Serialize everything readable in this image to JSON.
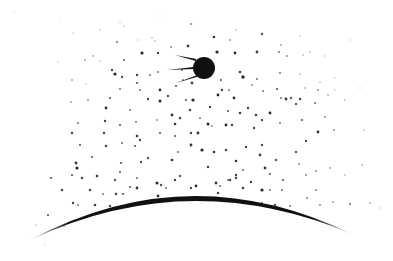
{
  "scene": {
    "description": "Illustration of a Sputnik-style satellite orbiting above a curved planet horizon in a star-speckled sky",
    "background_color": "#ffffff",
    "ink_color": "#111111",
    "satellite": {
      "icon": "sputnik-satellite-icon",
      "cx": 204,
      "cy": 68,
      "r": 11,
      "antennas": [
        {
          "x1": 196,
          "y1": 60,
          "x2": 175,
          "y2": 55
        },
        {
          "x1": 194,
          "y1": 68,
          "x2": 167,
          "y2": 70
        },
        {
          "x1": 197,
          "y1": 76,
          "x2": 176,
          "y2": 83
        }
      ]
    },
    "horizon": {
      "icon": "planet-horizon-arc",
      "start": [
        30,
        240
      ],
      "peak": [
        190,
        196
      ],
      "end": [
        352,
        234
      ],
      "thickness": 5
    },
    "stars": [
      [
        14,
        12,
        0.6,
        0.25
      ],
      [
        60,
        18,
        0.6,
        0.2
      ],
      [
        120,
        22,
        0.7,
        0.3
      ],
      [
        160,
        16,
        0.6,
        0.25
      ],
      [
        236,
        30,
        0.8,
        0.35
      ],
      [
        262,
        34,
        1.2,
        0.7
      ],
      [
        300,
        36,
        0.8,
        0.3
      ],
      [
        350,
        40,
        0.7,
        0.25
      ],
      [
        73,
        33,
        0.7,
        0.3
      ],
      [
        100,
        30,
        0.8,
        0.3
      ],
      [
        124,
        26,
        0.7,
        0.35
      ],
      [
        152,
        38,
        0.8,
        0.4
      ],
      [
        191,
        24,
        1.1,
        0.5
      ],
      [
        214,
        37,
        1.3,
        0.85
      ],
      [
        230,
        40,
        0.9,
        0.5
      ],
      [
        281,
        45,
        0.9,
        0.4
      ],
      [
        117,
        42,
        1.3,
        0.4
      ],
      [
        138,
        40,
        0.7,
        0.3
      ],
      [
        155,
        41,
        0.8,
        0.4
      ],
      [
        188,
        46,
        1.4,
        0.8
      ],
      [
        217,
        52,
        1.6,
        0.9
      ],
      [
        235,
        53,
        1.4,
        0.9
      ],
      [
        257,
        52,
        1.4,
        0.8
      ],
      [
        279,
        52,
        1.0,
        0.6
      ],
      [
        310,
        52,
        0.8,
        0.4
      ],
      [
        85,
        60,
        0.9,
        0.4
      ],
      [
        100,
        61,
        0.8,
        0.35
      ],
      [
        124,
        60,
        1.0,
        0.7
      ],
      [
        142,
        53,
        1.6,
        0.9
      ],
      [
        158,
        53,
        1.2,
        0.8
      ],
      [
        171,
        47,
        1.0,
        0.5
      ],
      [
        287,
        56,
        0.9,
        0.5
      ],
      [
        303,
        55,
        0.8,
        0.4
      ],
      [
        325,
        56,
        0.7,
        0.35
      ],
      [
        58,
        62,
        0.7,
        0.3
      ],
      [
        93,
        56,
        0.9,
        0.4
      ],
      [
        112,
        70,
        1.2,
        0.75
      ],
      [
        115,
        74,
        1.6,
        0.9
      ],
      [
        122,
        77,
        1.2,
        0.7
      ],
      [
        137,
        75,
        1.2,
        0.8
      ],
      [
        150,
        75,
        1.0,
        0.6
      ],
      [
        158,
        72,
        1.0,
        0.6
      ],
      [
        182,
        70,
        1.0,
        0.6
      ],
      [
        240,
        72,
        1.3,
        0.8
      ],
      [
        243,
        77,
        1.7,
        0.9
      ],
      [
        257,
        79,
        1.0,
        0.6
      ],
      [
        280,
        73,
        1.0,
        0.6
      ],
      [
        300,
        74,
        0.8,
        0.4
      ],
      [
        320,
        82,
        0.8,
        0.4
      ],
      [
        335,
        78,
        0.7,
        0.3
      ],
      [
        72,
        80,
        0.9,
        0.4
      ],
      [
        86,
        84,
        0.8,
        0.3
      ],
      [
        120,
        89,
        1.0,
        0.6
      ],
      [
        137,
        83,
        1.1,
        0.7
      ],
      [
        140,
        90,
        1.0,
        0.6
      ],
      [
        160,
        90,
        1.4,
        0.85
      ],
      [
        176,
        86,
        1.1,
        0.7
      ],
      [
        183,
        80,
        1.0,
        0.6
      ],
      [
        192,
        83,
        1.4,
        0.8
      ],
      [
        221,
        80,
        1.1,
        0.7
      ],
      [
        222,
        90,
        1.2,
        0.8
      ],
      [
        229,
        90,
        1.0,
        0.6
      ],
      [
        252,
        85,
        0.9,
        0.5
      ],
      [
        263,
        91,
        1.0,
        0.6
      ],
      [
        277,
        89,
        1.1,
        0.7
      ],
      [
        305,
        88,
        0.8,
        0.5
      ],
      [
        318,
        90,
        0.9,
        0.5
      ],
      [
        335,
        90,
        0.7,
        0.35
      ],
      [
        110,
        98,
        1.1,
        0.7
      ],
      [
        148,
        99,
        1.2,
        0.8
      ],
      [
        160,
        101,
        1.5,
        0.9
      ],
      [
        168,
        96,
        1.2,
        0.75
      ],
      [
        186,
        100,
        1.1,
        0.7
      ],
      [
        193,
        100,
        1.6,
        0.9
      ],
      [
        218,
        95,
        1.4,
        0.9
      ],
      [
        234,
        98,
        1.4,
        0.85
      ],
      [
        248,
        108,
        1.2,
        0.8
      ],
      [
        281,
        98,
        1.0,
        0.6
      ],
      [
        286,
        99,
        1.4,
        0.85
      ],
      [
        291,
        98,
        1.2,
        0.7
      ],
      [
        300,
        99,
        1.2,
        0.8
      ],
      [
        315,
        103,
        1.0,
        0.6
      ],
      [
        328,
        95,
        0.8,
        0.5
      ],
      [
        345,
        100,
        0.8,
        0.4
      ],
      [
        360,
        88,
        0.7,
        0.3
      ],
      [
        71,
        102,
        0.9,
        0.4
      ],
      [
        88,
        100,
        1.0,
        0.5
      ],
      [
        106,
        108,
        1.4,
        0.85
      ],
      [
        130,
        110,
        1.0,
        0.6
      ],
      [
        172,
        115,
        1.4,
        0.85
      ],
      [
        180,
        118,
        1.2,
        0.8
      ],
      [
        190,
        110,
        1.2,
        0.8
      ],
      [
        200,
        118,
        1.0,
        0.6
      ],
      [
        210,
        107,
        1.2,
        0.8
      ],
      [
        228,
        111,
        1.1,
        0.7
      ],
      [
        240,
        113,
        1.3,
        0.8
      ],
      [
        256,
        115,
        1.3,
        0.8
      ],
      [
        262,
        120,
        1.2,
        0.75
      ],
      [
        270,
        113,
        1.4,
        0.9
      ],
      [
        296,
        104,
        1.2,
        0.7
      ],
      [
        302,
        120,
        1.1,
        0.7
      ],
      [
        325,
        117,
        1.0,
        0.5
      ],
      [
        78,
        123,
        1.0,
        0.6
      ],
      [
        105,
        121,
        1.2,
        0.8
      ],
      [
        120,
        125,
        1.1,
        0.7
      ],
      [
        136,
        122,
        1.0,
        0.6
      ],
      [
        157,
        120,
        0.9,
        0.5
      ],
      [
        175,
        124,
        1.3,
        0.85
      ],
      [
        191,
        133,
        1.2,
        0.8
      ],
      [
        198,
        133,
        1.4,
        0.85
      ],
      [
        212,
        126,
        0.9,
        0.5
      ],
      [
        226,
        125,
        1.4,
        0.9
      ],
      [
        232,
        125,
        1.2,
        0.8
      ],
      [
        254,
        128,
        1.2,
        0.8
      ],
      [
        262,
        145,
        1.2,
        0.75
      ],
      [
        280,
        123,
        1.0,
        0.6
      ],
      [
        306,
        141,
        1.2,
        0.75
      ],
      [
        318,
        132,
        1.4,
        0.85
      ],
      [
        334,
        130,
        0.9,
        0.5
      ],
      [
        364,
        130,
        0.8,
        0.35
      ],
      [
        72,
        133,
        1.2,
        0.8
      ],
      [
        80,
        145,
        1.1,
        0.7
      ],
      [
        104,
        133,
        1.2,
        0.8
      ],
      [
        122,
        143,
        1.1,
        0.6
      ],
      [
        137,
        136,
        1.3,
        0.85
      ],
      [
        160,
        133,
        1.1,
        0.7
      ],
      [
        175,
        136,
        1.1,
        0.7
      ],
      [
        191,
        145,
        1.4,
        0.85
      ],
      [
        208,
        124,
        1.5,
        0.9
      ],
      [
        76,
        163,
        1.4,
        0.85
      ],
      [
        92,
        157,
        1.1,
        0.7
      ],
      [
        106,
        146,
        1.2,
        0.8
      ],
      [
        121,
        163,
        1.1,
        0.7
      ],
      [
        135,
        146,
        1.1,
        0.7
      ],
      [
        140,
        140,
        1.2,
        0.75
      ],
      [
        148,
        158,
        1.2,
        0.7
      ],
      [
        172,
        160,
        1.3,
        0.85
      ],
      [
        178,
        152,
        1.1,
        0.6
      ],
      [
        202,
        150,
        1.6,
        0.9
      ],
      [
        214,
        152,
        1.3,
        0.85
      ],
      [
        226,
        150,
        1.2,
        0.8
      ],
      [
        236,
        161,
        1.3,
        0.85
      ],
      [
        246,
        147,
        1.2,
        0.8
      ],
      [
        260,
        155,
        1.4,
        0.8
      ],
      [
        265,
        168,
        1.4,
        0.85
      ],
      [
        276,
        160,
        1.2,
        0.7
      ],
      [
        296,
        152,
        1.2,
        0.7
      ],
      [
        51,
        178,
        1.1,
        0.7
      ],
      [
        72,
        175,
        1.1,
        0.7
      ],
      [
        77,
        168,
        1.6,
        0.9
      ],
      [
        82,
        178,
        1.2,
        0.8
      ],
      [
        97,
        176,
        1.3,
        0.85
      ],
      [
        115,
        180,
        1.2,
        0.7
      ],
      [
        120,
        172,
        1.1,
        0.7
      ],
      [
        141,
        162,
        1.2,
        0.75
      ],
      [
        157,
        183,
        1.5,
        0.9
      ],
      [
        161,
        185,
        1.2,
        0.75
      ],
      [
        180,
        176,
        1.2,
        0.7
      ],
      [
        191,
        188,
        1.2,
        0.75
      ],
      [
        208,
        167,
        1.2,
        0.8
      ],
      [
        216,
        183,
        1.4,
        0.85
      ],
      [
        220,
        186,
        1.1,
        0.6
      ],
      [
        236,
        175,
        1.2,
        0.8
      ],
      [
        243,
        170,
        1.1,
        0.6
      ],
      [
        270,
        174,
        1.1,
        0.7
      ],
      [
        283,
        180,
        1.1,
        0.7
      ],
      [
        299,
        164,
        1.0,
        0.5
      ],
      [
        306,
        175,
        1.0,
        0.5
      ],
      [
        316,
        171,
        1.0,
        0.5
      ],
      [
        330,
        168,
        0.9,
        0.4
      ],
      [
        345,
        175,
        0.8,
        0.35
      ],
      [
        362,
        165,
        0.9,
        0.3
      ],
      [
        62,
        190,
        1.2,
        0.8
      ],
      [
        90,
        190,
        1.2,
        0.8
      ],
      [
        116,
        194,
        1.2,
        0.8
      ],
      [
        130,
        187,
        1.1,
        0.7
      ],
      [
        137,
        178,
        1.1,
        0.6
      ],
      [
        158,
        196,
        1.4,
        0.85
      ],
      [
        196,
        186,
        1.4,
        0.85
      ],
      [
        218,
        193,
        1.2,
        0.8
      ],
      [
        230,
        180,
        1.2,
        0.8
      ],
      [
        236,
        178,
        1.2,
        0.75
      ],
      [
        251,
        182,
        1.2,
        0.8
      ],
      [
        262,
        190,
        1.6,
        0.9
      ],
      [
        270,
        190,
        1.0,
        0.6
      ],
      [
        282,
        190,
        1.1,
        0.6
      ],
      [
        307,
        198,
        1.0,
        0.5
      ],
      [
        316,
        190,
        1.0,
        0.5
      ],
      [
        333,
        202,
        0.9,
        0.45
      ],
      [
        73,
        203,
        1.2,
        0.8
      ],
      [
        95,
        205,
        1.3,
        0.8
      ],
      [
        110,
        206,
        1.2,
        0.8
      ],
      [
        137,
        188,
        1.4,
        0.85
      ],
      [
        166,
        188,
        1.0,
        0.6
      ],
      [
        175,
        180,
        1.2,
        0.8
      ],
      [
        228,
        180,
        1.1,
        0.6
      ],
      [
        243,
        188,
        1.3,
        0.8
      ],
      [
        48,
        215,
        1.1,
        0.7
      ],
      [
        78,
        205,
        1.0,
        0.6
      ],
      [
        103,
        194,
        1.0,
        0.6
      ],
      [
        123,
        194,
        1.1,
        0.7
      ],
      [
        262,
        203,
        1.1,
        0.7
      ],
      [
        275,
        205,
        1.2,
        0.75
      ],
      [
        290,
        206,
        1.0,
        0.55
      ],
      [
        320,
        205,
        0.9,
        0.5
      ],
      [
        350,
        204,
        1.2,
        0.45
      ],
      [
        370,
        203,
        0.9,
        0.35
      ],
      [
        64,
        226,
        0.9,
        0.35
      ],
      [
        36,
        225,
        0.8,
        0.3
      ],
      [
        45,
        245,
        0.8,
        0.2
      ],
      [
        380,
        208,
        0.7,
        0.25
      ]
    ]
  }
}
